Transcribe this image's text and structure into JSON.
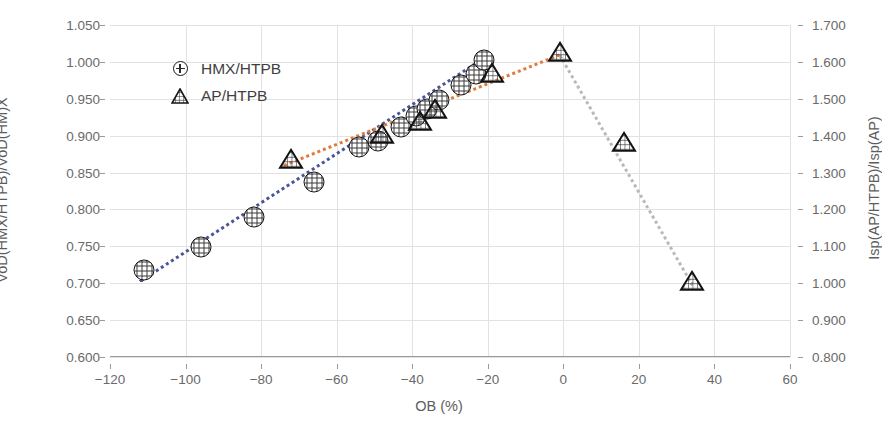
{
  "chart_data": {
    "type": "scatter",
    "title": "",
    "xlabel": "OB (%)",
    "ylabel": "VoD(HMX/HTPB)/VoD(HM)X",
    "y2label": "Isp(AP/HTPB)/Isp(AP)",
    "xlim": [
      -120,
      60
    ],
    "ylim": [
      0.6,
      1.05
    ],
    "y2lim": [
      0.8,
      1.7
    ],
    "xticks": [
      "−120",
      "−100",
      "−80",
      "−60",
      "−40",
      "−20",
      "0",
      "20",
      "40",
      "60"
    ],
    "xtick_values": [
      -120,
      -100,
      -80,
      -60,
      -40,
      -20,
      0,
      20,
      40,
      60
    ],
    "yticks": [
      "0.600",
      "0.650",
      "0.700",
      "0.750",
      "0.800",
      "0.850",
      "0.900",
      "0.950",
      "1.000",
      "1.050"
    ],
    "ytick_values": [
      0.6,
      0.65,
      0.7,
      0.75,
      0.8,
      0.85,
      0.9,
      0.95,
      1.0,
      1.05
    ],
    "y2ticks": [
      "0.800",
      "0.900",
      "1.000",
      "1.100",
      "1.200",
      "1.300",
      "1.400",
      "1.500",
      "1.600",
      "1.700"
    ],
    "y2tick_values": [
      0.8,
      0.9,
      1.0,
      1.1,
      1.2,
      1.3,
      1.4,
      1.5,
      1.6,
      1.7
    ],
    "grid": true,
    "legend_position": "upper-left",
    "series": [
      {
        "name": "HMX/HTPB",
        "marker": "circle",
        "axis": "left",
        "color": "#4a5596",
        "trend_color": "#4a5596",
        "points": [
          {
            "x": -111,
            "y": 0.718
          },
          {
            "x": -96,
            "y": 0.749
          },
          {
            "x": -82,
            "y": 0.79
          },
          {
            "x": -66,
            "y": 0.837
          },
          {
            "x": -54,
            "y": 0.884
          },
          {
            "x": -49,
            "y": 0.893
          },
          {
            "x": -43,
            "y": 0.912
          },
          {
            "x": -39,
            "y": 0.926
          },
          {
            "x": -36,
            "y": 0.936
          },
          {
            "x": -33,
            "y": 0.948
          },
          {
            "x": -27,
            "y": 0.968
          },
          {
            "x": -23,
            "y": 0.984
          },
          {
            "x": -21,
            "y": 1.003
          }
        ]
      },
      {
        "name": "AP/HTPB",
        "marker": "triangle",
        "axis": "right",
        "color": "#e07a3c",
        "trend_color": "#e07a3c",
        "decline_color": "#b9b9bd",
        "points": [
          {
            "x": -72,
            "y": 1.33
          },
          {
            "x": -48,
            "y": 1.4
          },
          {
            "x": -38,
            "y": 1.434
          },
          {
            "x": -34,
            "y": 1.466
          },
          {
            "x": -19,
            "y": 1.565
          },
          {
            "x": -1,
            "y": 1.622
          },
          {
            "x": 16,
            "y": 1.378
          },
          {
            "x": 34,
            "y": 1.0
          }
        ]
      }
    ],
    "trendlines": [
      {
        "name": "hmx-trend",
        "color": "#4a5596",
        "style": "dotted",
        "x0": -112,
        "y0": 0.704,
        "x1": -20,
        "y1": 1.01,
        "axis": "left"
      },
      {
        "name": "ap-trend-rise",
        "color": "#e07a3c",
        "style": "dotted",
        "x0": -74,
        "y0": 1.322,
        "x1": -1,
        "y1": 1.622,
        "axis": "right"
      },
      {
        "name": "ap-trend-fall",
        "color": "#b9b9bd",
        "style": "dotted",
        "x0": -1,
        "y0": 1.622,
        "x1": 34,
        "y1": 1.0,
        "axis": "right"
      }
    ]
  },
  "legend": {
    "entries": [
      {
        "label": "HMX/HTPB",
        "marker": "circle-crosshatch-icon"
      },
      {
        "label": "AP/HTPB",
        "marker": "triangle-crosshatch-icon"
      }
    ]
  }
}
